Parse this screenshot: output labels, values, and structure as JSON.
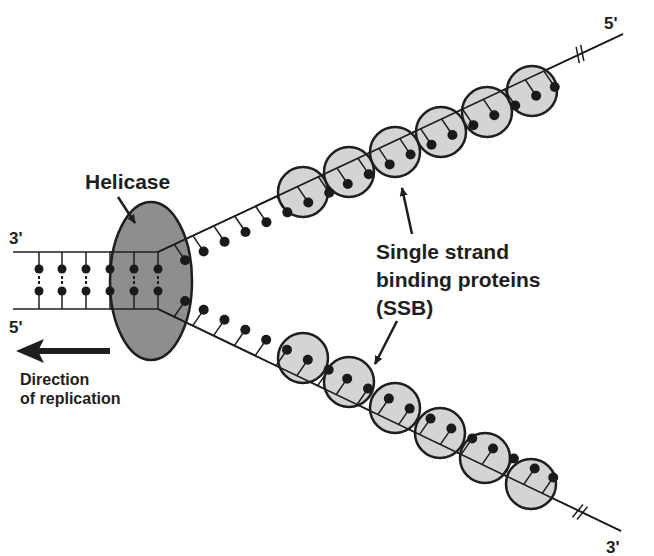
{
  "labels": {
    "helicase": "Helicase",
    "ssb_line1": "Single strand",
    "ssb_line2": "binding proteins",
    "ssb_line3": "(SSB)",
    "direction_line1": "Direction",
    "direction_line2": "of replication",
    "left_top_end": "3'",
    "left_bottom_end": "5'",
    "upper_strand_end": "5'",
    "lower_strand_end": "3'"
  },
  "colors": {
    "ink": "#1e1e1e",
    "helicase_fill": "#8e8e8e",
    "ssb_fill": "#d4d4d4",
    "base_dot": "#1a1a1a"
  },
  "diagram": {
    "duplex": {
      "x_start": 13,
      "x_fork": 158,
      "top_y": 252,
      "bottom_y": 309,
      "rung_x": [
        39,
        62,
        86,
        110,
        134,
        158
      ],
      "dot_top_y": 269,
      "dot_bottom_y": 291
    },
    "helicase": {
      "cx": 151,
      "cy": 281,
      "rx": 41,
      "ry": 79
    },
    "upper_strand": {
      "start": [
        158,
        252
      ],
      "end": [
        623,
        34
      ],
      "break_at": [
        580,
        54
      ],
      "ssb_centers": [
        [
          303,
          192
        ],
        [
          349,
          172
        ],
        [
          395,
          152
        ],
        [
          441,
          132
        ],
        [
          487,
          112
        ],
        [
          532,
          91
        ]
      ],
      "pendant_t": [
        0.035,
        0.075,
        0.12,
        0.165,
        0.21,
        0.255,
        0.3,
        0.345,
        0.385,
        0.43,
        0.475,
        0.52,
        0.565,
        0.61,
        0.655,
        0.7,
        0.745,
        0.79,
        0.83
      ]
    },
    "lower_strand": {
      "start": [
        158,
        309
      ],
      "end": [
        621,
        531
      ],
      "break_at": [
        580,
        512
      ],
      "ssb_centers": [
        [
          303,
          358
        ],
        [
          349,
          382
        ],
        [
          395,
          408
        ],
        [
          440,
          433
        ],
        [
          485,
          458
        ],
        [
          531,
          484
        ]
      ],
      "pendant_t": [
        0.035,
        0.075,
        0.12,
        0.165,
        0.21,
        0.255,
        0.3,
        0.345,
        0.385,
        0.43,
        0.475,
        0.52,
        0.565,
        0.61,
        0.655,
        0.7,
        0.745,
        0.79,
        0.83
      ]
    },
    "ssb_radius": 25
  }
}
